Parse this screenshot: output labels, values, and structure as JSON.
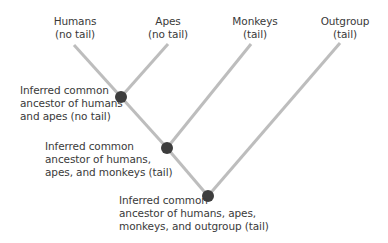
{
  "diagram": {
    "type": "phylogenetic-tree",
    "colors": {
      "branch": "#bdbdbd",
      "node": "#3d3d3d",
      "text": "#3a3a3a"
    },
    "taxa": [
      {
        "id": "humans",
        "name": "Humans",
        "trait": "(no tail)"
      },
      {
        "id": "apes",
        "name": "Apes",
        "trait": "(no tail)"
      },
      {
        "id": "monkeys",
        "name": "Monkeys",
        "trait": "(tail)"
      },
      {
        "id": "outgroup",
        "name": "Outgroup",
        "trait": "(tail)"
      }
    ],
    "nodes": [
      {
        "id": "node-humans-apes",
        "lines": [
          "Inferred common",
          "ancestor of humans",
          "and apes (no tail)"
        ]
      },
      {
        "id": "node-humans-apes-monkeys",
        "lines": [
          "Inferred common",
          "ancestor of humans,",
          "apes, and monkeys (tail)"
        ]
      },
      {
        "id": "node-root",
        "lines": [
          "Inferred common",
          "ancestor of humans, apes,",
          "monkeys, and outgroup (tail)"
        ]
      }
    ]
  }
}
